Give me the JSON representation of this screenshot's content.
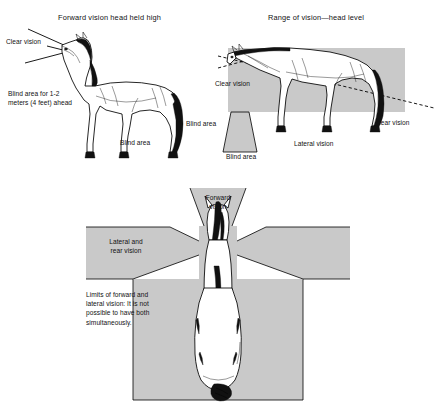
{
  "figure": {
    "colors": {
      "shade": "#c9c9c9",
      "ink": "#000000",
      "paper": "#ffffff"
    }
  },
  "panels": {
    "top_left": {
      "title": "Forward vision head held high",
      "labels": {
        "clear_vision": "Clear vision",
        "blind_area_front": "Blind area for 1-2\nmeters (4 feet) ahead",
        "blind_area_front_line1": "Blind area for 1-2",
        "blind_area_front_line2": "meters (4 feet) ahead",
        "blind_area_under": "Blind area",
        "blind_area_rear": "Blind area"
      }
    },
    "top_right": {
      "title": "Range of vision—head level",
      "labels": {
        "clear_vision": "Clear vision",
        "blind_area": "Blind area",
        "lateral_vision": "Lateral vision",
        "rear_vision": "Rear vision"
      }
    },
    "bottom": {
      "labels": {
        "forward_vision_line1": "Forward",
        "forward_vision_line2": "vision",
        "lateral_rear_line1": "Lateral and",
        "lateral_rear_line2": "rear vision",
        "limits_line1": "Limits of forward and",
        "limits_line2": "lateral vision: It is not",
        "limits_line3": "possible to have both",
        "limits_line4": "simultaneously."
      }
    }
  }
}
